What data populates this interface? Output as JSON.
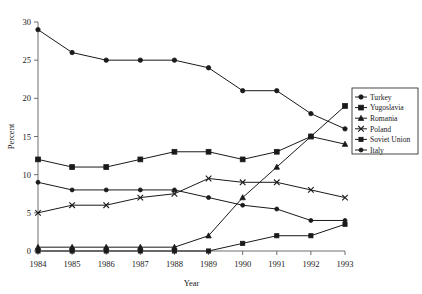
{
  "chart_data": {
    "type": "line",
    "title": "",
    "xlabel": "Year",
    "ylabel": "Percent",
    "categories": [
      "1984",
      "1985",
      "1986",
      "1987",
      "1988",
      "1989",
      "1990",
      "1991",
      "1992",
      "1993"
    ],
    "x": [
      1984,
      1985,
      1986,
      1987,
      1988,
      1989,
      1990,
      1991,
      1992,
      1993
    ],
    "xlim": [
      1984,
      1993
    ],
    "ylim": [
      0,
      30
    ],
    "yticks": [
      0,
      5,
      10,
      15,
      20,
      25,
      30
    ],
    "ytick_labels": [
      "0",
      "5",
      "10",
      "15",
      "20",
      "25",
      "30"
    ],
    "grid": false,
    "legend_position": "right",
    "series": [
      {
        "name": "Turkey",
        "marker": "circle",
        "values": [
          29,
          26,
          25,
          25,
          25,
          24,
          21,
          21,
          18,
          16
        ]
      },
      {
        "name": "Yugoslavia",
        "marker": "square",
        "values": [
          12,
          11,
          11,
          12,
          13,
          13,
          12,
          13,
          15,
          19
        ]
      },
      {
        "name": "Romania",
        "marker": "triangle",
        "values": [
          0.5,
          0.5,
          0.5,
          0.5,
          0.5,
          2,
          7,
          11,
          15,
          14
        ]
      },
      {
        "name": "Poland",
        "marker": "cross",
        "values": [
          5,
          6,
          6,
          7,
          7.5,
          9.5,
          9,
          9,
          8,
          7
        ]
      },
      {
        "name": "Soviet Union",
        "marker": "square-small",
        "values": [
          0,
          0,
          0,
          0,
          0,
          0,
          1,
          2,
          2,
          3.5
        ]
      },
      {
        "name": "Italy",
        "marker": "circle-small",
        "values": [
          9,
          8,
          8,
          8,
          8,
          7,
          6,
          5.5,
          4,
          4
        ]
      }
    ]
  },
  "legend": {
    "entries": [
      {
        "label": "Turkey"
      },
      {
        "label": "Yugoslavia"
      },
      {
        "label": "Romania"
      },
      {
        "label": "Poland"
      },
      {
        "label": "Soviet Union"
      },
      {
        "label": "Italy"
      }
    ]
  }
}
